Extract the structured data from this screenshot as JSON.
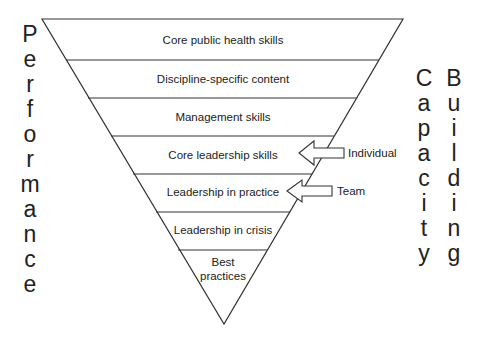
{
  "diagram": {
    "left_vertical_word": "Performance",
    "right_vertical_words": [
      "Capacity",
      "Building"
    ],
    "layers": [
      {
        "label": "Core public health skills"
      },
      {
        "label": "Discipline-specific content"
      },
      {
        "label": "Management skills"
      },
      {
        "label": "Core leadership skills"
      },
      {
        "label": "Leadership in practice"
      },
      {
        "label": "Leadership in crisis"
      },
      {
        "label_line1": "Best",
        "label_line2": "practices"
      }
    ],
    "arrows": [
      {
        "label": "Individual",
        "points_to": "Core leadership skills"
      },
      {
        "label": "Team",
        "points_to": "Leadership in practice"
      }
    ],
    "colors": {
      "stroke": "#333333",
      "text": "#222222",
      "background": "#ffffff"
    }
  }
}
